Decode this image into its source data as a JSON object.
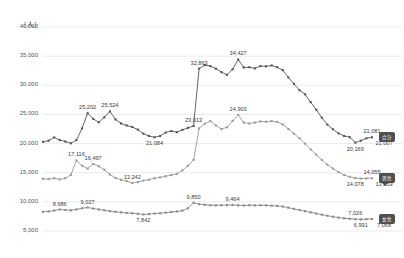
{
  "chart_data": {
    "type": "line",
    "title": "",
    "subtitle": "",
    "unit_label": "〔人〕",
    "xlabel": "",
    "ylabel": "",
    "ylim": [
      5000,
      40000
    ],
    "ytick_labels": [
      "40,000",
      "35,000",
      "30,000",
      "25,000",
      "20,000",
      "15,000",
      "10,000",
      "5,000"
    ],
    "ytick_values": [
      40000,
      35000,
      30000,
      25000,
      20000,
      15000,
      10000,
      5000
    ],
    "grid": true,
    "legend_position": "right-inline",
    "x": [
      1,
      2,
      3,
      4,
      5,
      6,
      7,
      8,
      9,
      10,
      11,
      12,
      13,
      14,
      15,
      16,
      17,
      18,
      19,
      20,
      21,
      22,
      23,
      24,
      25,
      26,
      27,
      28,
      29,
      30,
      31,
      32,
      33,
      34,
      35,
      36,
      37,
      38,
      39,
      40,
      41,
      42,
      43,
      44,
      45,
      46,
      47,
      48,
      49,
      50,
      51,
      52,
      53,
      54,
      55,
      56,
      57,
      58,
      59,
      60
    ],
    "series": [
      {
        "name": "series-top",
        "color": "#555555",
        "end_value": 21007,
        "values": [
          20300,
          20500,
          21050,
          20600,
          20350,
          20050,
          20600,
          22600,
          25202,
          24250,
          23650,
          24500,
          25524,
          24150,
          23450,
          23100,
          22850,
          22400,
          21700,
          21300,
          21084,
          21300,
          21900,
          22150,
          21950,
          22350,
          22700,
          23013,
          32863,
          33450,
          33300,
          32850,
          32250,
          31800,
          32750,
          34427,
          33050,
          33100,
          32900,
          33300,
          33250,
          33400,
          33100,
          32600,
          31350,
          30250,
          29150,
          28450,
          27100,
          25800,
          24450,
          23250,
          22450,
          21750,
          21300,
          21100,
          20169,
          20500,
          20900,
          21081
        ]
      },
      {
        "name": "series-middle",
        "color": "#9a9a9a",
        "end_value": 13959,
        "values": [
          13950,
          13900,
          14050,
          13850,
          14050,
          14650,
          17116,
          16200,
          15700,
          16497,
          16100,
          15500,
          14700,
          14100,
          13800,
          13550,
          13242,
          13400,
          13650,
          13800,
          14050,
          14200,
          14400,
          14600,
          14800,
          15400,
          16200,
          17200,
          22600,
          23400,
          23850,
          23100,
          22500,
          22800,
          23900,
          24903,
          23600,
          23450,
          23600,
          23800,
          23750,
          23850,
          23700,
          23300,
          22500,
          21700,
          20900,
          20000,
          19000,
          18100,
          17200,
          16400,
          15700,
          15100,
          14600,
          14300,
          14078,
          14000,
          14020,
          14055
        ]
      },
      {
        "name": "series-bottom",
        "color": "#888888",
        "end_value": 7068,
        "values": [
          8300,
          8350,
          8500,
          8686,
          8600,
          8550,
          8700,
          8900,
          9027,
          8850,
          8700,
          8550,
          8400,
          8300,
          8200,
          8100,
          8050,
          7950,
          7842,
          7900,
          8000,
          8050,
          8150,
          8250,
          8350,
          8500,
          8900,
          9850,
          9600,
          9500,
          9430,
          9400,
          9420,
          9450,
          9464,
          9400,
          9380,
          9420,
          9400,
          9430,
          9400,
          9350,
          9300,
          9200,
          9000,
          8800,
          8600,
          8400,
          8200,
          8000,
          7800,
          7620,
          7450,
          7300,
          7180,
          7100,
          7026,
          6991,
          7030,
          7068
        ]
      }
    ],
    "data_labels": [
      {
        "text": "25,202",
        "series": "series-top",
        "index": 8
      },
      {
        "text": "25,524",
        "series": "series-top",
        "index": 12
      },
      {
        "text": "21,084",
        "series": "series-top",
        "index": 20
      },
      {
        "text": "23,013",
        "series": "series-top",
        "index": 27
      },
      {
        "text": "32,863",
        "series": "series-top",
        "index": 28
      },
      {
        "text": "34,427",
        "series": "series-top",
        "index": 35
      },
      {
        "text": "20,169",
        "series": "series-top",
        "index": 56
      },
      {
        "text": "21,081",
        "series": "series-top",
        "index": 59
      },
      {
        "text": "21,007",
        "series": "series-top",
        "index": 60
      },
      {
        "text": "17,116",
        "series": "series-middle",
        "index": 6
      },
      {
        "text": "16,497",
        "series": "series-middle",
        "index": 9
      },
      {
        "text": "13,242",
        "series": "series-middle",
        "index": 16
      },
      {
        "text": "24,903",
        "series": "series-middle",
        "index": 35
      },
      {
        "text": "14,055",
        "series": "series-middle",
        "index": 59
      },
      {
        "text": "14,078",
        "series": "series-middle",
        "index": 56
      },
      {
        "text": "13,959",
        "series": "series-middle",
        "index": 60
      },
      {
        "text": "8,686",
        "series": "series-bottom",
        "index": 3
      },
      {
        "text": "9,027",
        "series": "series-bottom",
        "index": 8
      },
      {
        "text": "7,842",
        "series": "series-bottom",
        "index": 18
      },
      {
        "text": "9,850",
        "series": "series-bottom",
        "index": 27
      },
      {
        "text": "9,464",
        "series": "series-bottom",
        "index": 34
      },
      {
        "text": "7,026",
        "series": "series-bottom",
        "index": 56
      },
      {
        "text": "6,991",
        "series": "series-bottom",
        "index": 57
      },
      {
        "text": "7,068",
        "series": "series-bottom",
        "index": 60
      }
    ],
    "end_badges": [
      {
        "text": "合計",
        "series": "series-top",
        "style": "solid"
      },
      {
        "text": "男性",
        "series": "series-middle",
        "style": "bubble"
      },
      {
        "text": "女性",
        "series": "series-bottom",
        "style": "solid"
      }
    ]
  }
}
